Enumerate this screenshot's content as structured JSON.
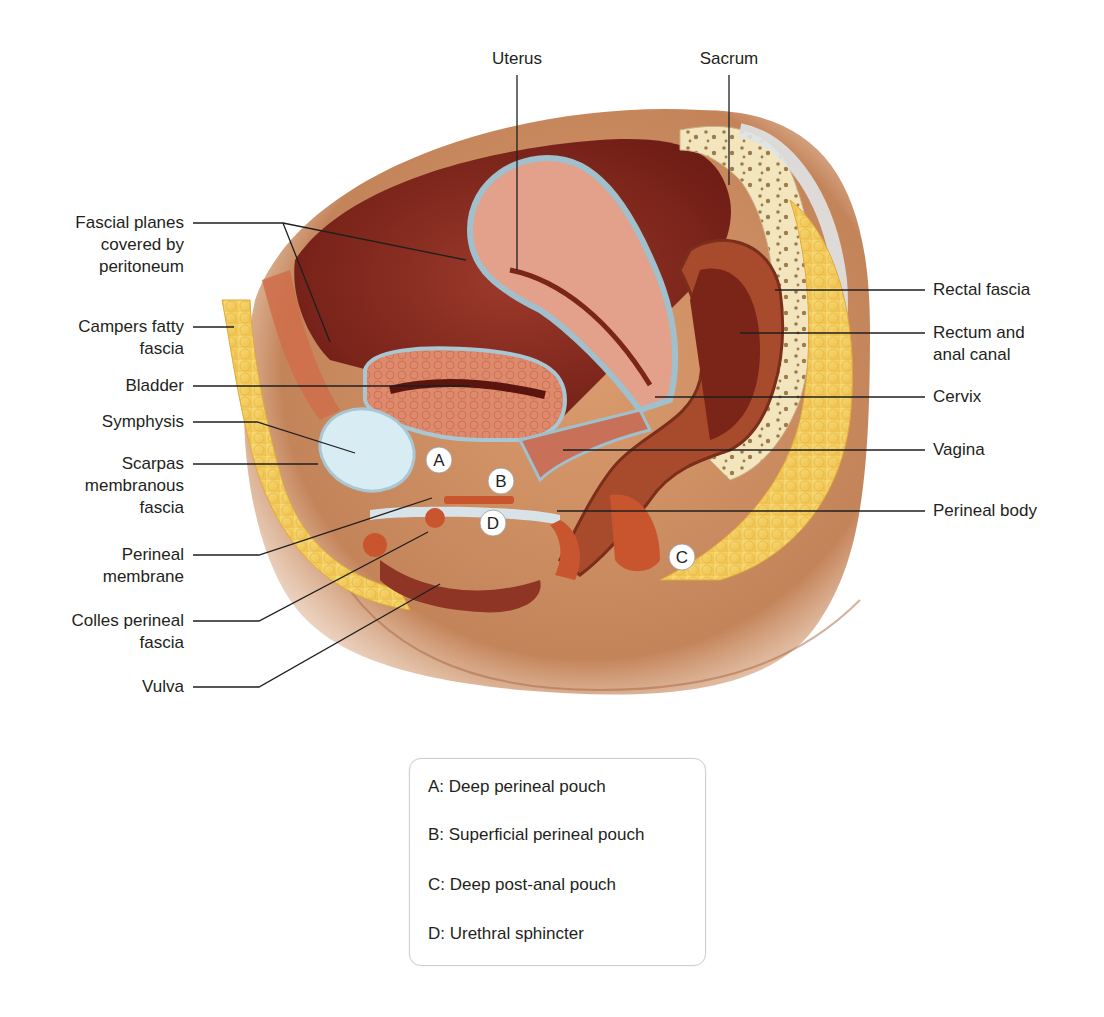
{
  "diagram": {
    "labels_top": [
      {
        "id": "uterus",
        "text": "Uterus"
      },
      {
        "id": "sacrum",
        "text": "Sacrum"
      }
    ],
    "labels_left": [
      {
        "id": "fascial-planes",
        "text": "Fascial planes\ncovered by\nperitoneum"
      },
      {
        "id": "campers",
        "text": "Campers fatty\nfascia"
      },
      {
        "id": "bladder",
        "text": "Bladder"
      },
      {
        "id": "symphysis",
        "text": "Symphysis"
      },
      {
        "id": "scarpas",
        "text": "Scarpas\nmembranous\nfascia"
      },
      {
        "id": "perineal-membrane",
        "text": "Perineal\nmembrane"
      },
      {
        "id": "colles",
        "text": "Colles perineal\nfascia"
      },
      {
        "id": "vulva",
        "text": "Vulva"
      }
    ],
    "labels_right": [
      {
        "id": "rectal-fascia",
        "text": "Rectal fascia"
      },
      {
        "id": "rectum",
        "text": "Rectum and\nanal canal"
      },
      {
        "id": "cervix",
        "text": "Cervix"
      },
      {
        "id": "vagina",
        "text": "Vagina"
      },
      {
        "id": "perineal-body",
        "text": "Perineal body"
      }
    ],
    "markers": [
      "A",
      "B",
      "C",
      "D"
    ],
    "colors": {
      "skin": "#c98a5e",
      "skin_dark": "#a7663f",
      "fat": "#f3cf5f",
      "fat_edge": "#e0a93a",
      "cavity": "#8a2a1f",
      "muscle": "#d9876b",
      "muscle_dark": "#b8502f",
      "fascia": "#a9c6d3",
      "bone": "#f3e6bf",
      "bone_spot": "#9c7b4a",
      "cartilage": "#d7ecf3",
      "line": "#1f1f1f"
    }
  },
  "legend": {
    "items": [
      {
        "key": "A",
        "text": "A: Deep perineal pouch"
      },
      {
        "key": "B",
        "text": "B: Superficial perineal pouch"
      },
      {
        "key": "C",
        "text": "C: Deep post-anal pouch"
      },
      {
        "key": "D",
        "text": "D: Urethral sphincter"
      }
    ]
  }
}
